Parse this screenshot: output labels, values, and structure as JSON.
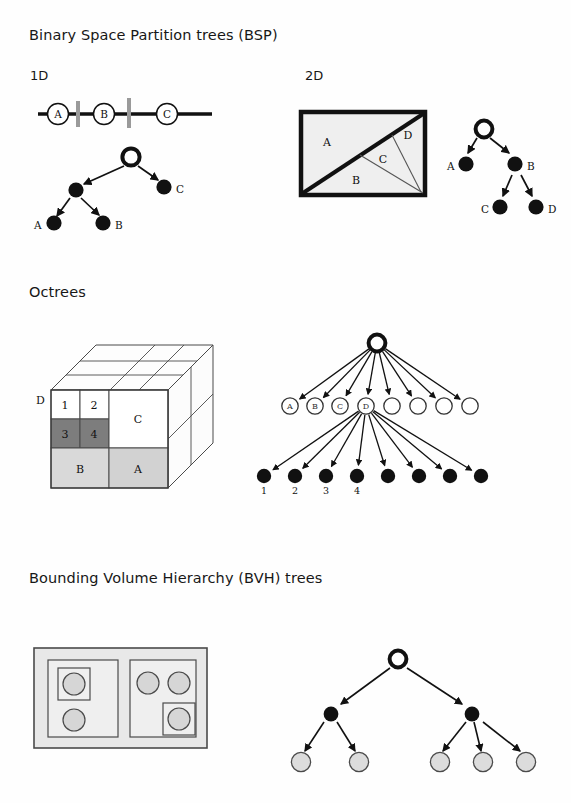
{
  "document": {
    "page_background": "#fefefe",
    "ink_color": "#111111"
  },
  "sections": {
    "bsp": {
      "heading": "Binary Space Partition trees (BSP)",
      "sub_labels": {
        "one_d": "1D",
        "two_d": "2D"
      },
      "one_d": {
        "line_segments": [
          "A",
          "B",
          "C"
        ],
        "split_marker_color": "#9a9a9a",
        "split_count": 2,
        "tree": {
          "root": {
            "label": "",
            "fill": "none",
            "stroke": "#111111"
          },
          "internal": [
            {
              "label": "",
              "fill": "#111111"
            }
          ],
          "leaves": [
            {
              "label": "A",
              "fill": "#111111"
            },
            {
              "label": "B",
              "fill": "#111111"
            },
            {
              "label": "C",
              "fill": "#111111"
            }
          ]
        }
      },
      "two_d": {
        "regions": [
          "A",
          "B",
          "C",
          "D"
        ],
        "rect_fill": "#efefef",
        "rect_stroke": "#111111",
        "tree": {
          "root": {
            "label": "",
            "fill": "none"
          },
          "nodes": [
            {
              "label": "A",
              "fill": "#111111"
            },
            {
              "label": "B",
              "fill": "#111111"
            },
            {
              "label": "C",
              "fill": "#111111"
            },
            {
              "label": "D",
              "fill": "#111111"
            }
          ]
        }
      }
    },
    "octrees": {
      "heading": "Octrees",
      "cube": {
        "corner_label": "D",
        "cells": [
          {
            "label": "1",
            "fill": "#ffffff"
          },
          {
            "label": "2",
            "fill": "#ffffff"
          },
          {
            "label": "3",
            "fill": "#7d7d7d"
          },
          {
            "label": "4",
            "fill": "#7d7d7d"
          },
          {
            "label": "C",
            "fill": "#ffffff"
          },
          {
            "label": "B",
            "fill": "#d9d9d9"
          },
          {
            "label": "A",
            "fill": "#d2d2d2"
          }
        ]
      },
      "tree": {
        "root": {
          "label": "",
          "fill": "none"
        },
        "level1": [
          {
            "label": "A",
            "fill": "none"
          },
          {
            "label": "B",
            "fill": "none"
          },
          {
            "label": "C",
            "fill": "none"
          },
          {
            "label": "D",
            "fill": "none"
          },
          {
            "label": "",
            "fill": "none"
          },
          {
            "label": "",
            "fill": "none"
          },
          {
            "label": "",
            "fill": "none"
          },
          {
            "label": "",
            "fill": "none"
          }
        ],
        "level2": [
          {
            "label": "1",
            "fill": "#111111"
          },
          {
            "label": "2",
            "fill": "#111111"
          },
          {
            "label": "3",
            "fill": "#111111"
          },
          {
            "label": "4",
            "fill": "#111111"
          },
          {
            "label": "",
            "fill": "#111111"
          },
          {
            "label": "",
            "fill": "#111111"
          },
          {
            "label": "",
            "fill": "#111111"
          },
          {
            "label": "",
            "fill": "#111111"
          }
        ],
        "expanded_node": "D",
        "branching_factor": 8
      }
    },
    "bvh": {
      "heading": "Bounding Volume Hierarchy (BVH) trees",
      "diagram": {
        "outer_box_fill": "#e8e8e8",
        "inner_box_fill": "#efefef",
        "object_fill": "#d6d6d6",
        "left_group_objects": 2,
        "right_group_objects": 3
      },
      "tree": {
        "root": {
          "label": "",
          "fill": "none"
        },
        "internal": [
          {
            "label": "",
            "fill": "#111111"
          },
          {
            "label": "",
            "fill": "#111111"
          }
        ],
        "leaves_left": [
          {
            "label": "",
            "fill": "#dcdcdc"
          },
          {
            "label": "",
            "fill": "#dcdcdc"
          }
        ],
        "leaves_right": [
          {
            "label": "",
            "fill": "#dcdcdc"
          },
          {
            "label": "",
            "fill": "#dcdcdc"
          },
          {
            "label": "",
            "fill": "#dcdcdc"
          }
        ]
      }
    }
  }
}
